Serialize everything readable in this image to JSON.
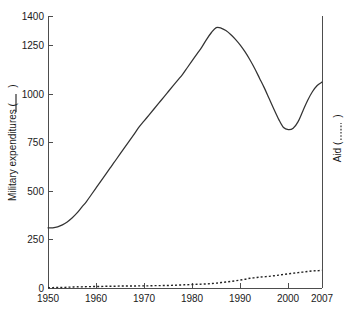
{
  "chart_data": {
    "type": "line",
    "title": "",
    "xlabel": "",
    "ylabel": "Military expenditures (     )",
    "y2label": "Aid (      )",
    "grid": false,
    "legend_position": "axis-labels",
    "xlim": [
      1950,
      2007
    ],
    "ylim": [
      0,
      1400
    ],
    "y2lim": [
      0,
      1400
    ],
    "x_ticks": [
      1950,
      1960,
      1970,
      1980,
      1990,
      2000,
      2007
    ],
    "x_tick_labels": [
      "1950",
      "1960",
      "1970",
      "1980",
      "1990",
      "2000",
      "2007"
    ],
    "y_ticks": [
      0,
      250,
      500,
      750,
      1000,
      1250,
      1400
    ],
    "y_tick_labels": [
      "0",
      "250",
      "500",
      "750",
      "1000",
      "1250",
      "1400"
    ],
    "series": [
      {
        "name": "Military expenditures",
        "style": "solid",
        "axis": "left",
        "color": "#333333",
        "x": [
          1950,
          1951,
          1952,
          1953,
          1954,
          1955,
          1956,
          1957,
          1958,
          1959,
          1960,
          1961,
          1962,
          1963,
          1964,
          1965,
          1966,
          1967,
          1968,
          1969,
          1970,
          1971,
          1972,
          1973,
          1974,
          1975,
          1976,
          1977,
          1978,
          1979,
          1980,
          1981,
          1982,
          1983,
          1984,
          1985,
          1986,
          1987,
          1988,
          1989,
          1990,
          1991,
          1992,
          1993,
          1994,
          1995,
          1996,
          1997,
          1998,
          1999,
          2000,
          2001,
          2002,
          2003,
          2004,
          2005,
          2006,
          2007
        ],
        "values": [
          310,
          310,
          315,
          325,
          340,
          360,
          385,
          415,
          445,
          480,
          515,
          550,
          585,
          620,
          655,
          690,
          725,
          760,
          795,
          830,
          860,
          890,
          920,
          950,
          980,
          1010,
          1040,
          1070,
          1100,
          1135,
          1170,
          1205,
          1240,
          1280,
          1315,
          1340,
          1338,
          1325,
          1305,
          1280,
          1250,
          1215,
          1175,
          1130,
          1080,
          1030,
          975,
          920,
          868,
          826,
          815,
          822,
          855,
          910,
          965,
          1010,
          1042,
          1060
        ]
      },
      {
        "name": "Aid",
        "style": "dotted",
        "axis": "right",
        "color": "#222222",
        "x": [
          1950,
          1951,
          1952,
          1953,
          1954,
          1955,
          1956,
          1957,
          1958,
          1959,
          1960,
          1961,
          1962,
          1963,
          1964,
          1965,
          1966,
          1967,
          1968,
          1969,
          1970,
          1971,
          1972,
          1973,
          1974,
          1975,
          1976,
          1977,
          1978,
          1979,
          1980,
          1981,
          1982,
          1983,
          1984,
          1985,
          1986,
          1987,
          1988,
          1989,
          1990,
          1991,
          1992,
          1993,
          1994,
          1995,
          1996,
          1997,
          1998,
          1999,
          2000,
          2001,
          2002,
          2003,
          2004,
          2005,
          2006,
          2007
        ],
        "values": [
          2,
          2,
          3,
          3,
          4,
          5,
          6,
          6,
          7,
          7,
          8,
          8,
          9,
          9,
          9,
          10,
          10,
          10,
          10,
          11,
          11,
          11,
          12,
          12,
          13,
          13,
          14,
          15,
          16,
          17,
          18,
          19,
          20,
          21,
          23,
          25,
          28,
          31,
          34,
          37,
          41,
          45,
          50,
          53,
          56,
          58,
          60,
          63,
          66,
          70,
          73,
          76,
          79,
          82,
          85,
          88,
          89,
          91
        ]
      }
    ],
    "annotations": []
  },
  "axis": {
    "left_title_text": "Military expenditures (",
    "left_title_close": ")",
    "right_title_text": "Aid (",
    "right_title_close": ")"
  }
}
